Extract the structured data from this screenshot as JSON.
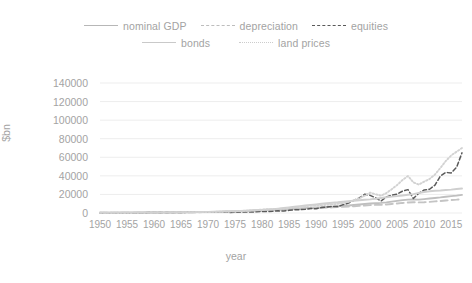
{
  "chart_data": {
    "type": "line",
    "title": "",
    "xlabel": "year",
    "ylabel": "$bn",
    "xlim": [
      1950,
      2017
    ],
    "ylim": [
      0,
      140000
    ],
    "grid": true,
    "legend_position": "top",
    "xticks": [
      1950,
      1955,
      1960,
      1965,
      1970,
      1975,
      1980,
      1985,
      1990,
      1995,
      2000,
      2005,
      2010,
      2015
    ],
    "yticks": [
      0,
      20000,
      40000,
      60000,
      80000,
      100000,
      120000,
      140000
    ],
    "x": [
      1950,
      1951,
      1952,
      1953,
      1954,
      1955,
      1956,
      1957,
      1958,
      1959,
      1960,
      1961,
      1962,
      1963,
      1964,
      1965,
      1966,
      1967,
      1968,
      1969,
      1970,
      1971,
      1972,
      1973,
      1974,
      1975,
      1976,
      1977,
      1978,
      1979,
      1980,
      1981,
      1982,
      1983,
      1984,
      1985,
      1986,
      1987,
      1988,
      1989,
      1990,
      1991,
      1992,
      1993,
      1994,
      1995,
      1996,
      1997,
      1998,
      1999,
      2000,
      2001,
      2002,
      2003,
      2004,
      2005,
      2006,
      2007,
      2008,
      2009,
      2010,
      2011,
      2012,
      2013,
      2014,
      2015,
      2016,
      2017
    ],
    "series": [
      {
        "name": "nominal GDP",
        "style": "solid",
        "color": "#bfbfbf",
        "values": [
          300,
          340,
          360,
          380,
          390,
          420,
          440,
          470,
          480,
          520,
          540,
          560,
          600,
          640,
          690,
          740,
          810,
          860,
          940,
          1020,
          1080,
          1170,
          1280,
          1430,
          1550,
          1690,
          1880,
          2090,
          2360,
          2630,
          2860,
          3210,
          3340,
          3630,
          4040,
          4340,
          4580,
          4860,
          5250,
          5660,
          5980,
          6170,
          6540,
          6880,
          7310,
          7660,
          8100,
          8610,
          9090,
          9660,
          10250,
          10580,
          10940,
          11460,
          12210,
          13040,
          13810,
          14450,
          14710,
          14450,
          14990,
          15540,
          16200,
          16780,
          17520,
          18220,
          18710,
          19490
        ]
      },
      {
        "name": "depreciation",
        "style": "longdash",
        "color": "#c4c4c4",
        "values": [
          250,
          280,
          300,
          320,
          340,
          370,
          400,
          430,
          450,
          480,
          500,
          520,
          550,
          580,
          620,
          670,
          720,
          780,
          850,
          930,
          1000,
          1080,
          1180,
          1300,
          1460,
          1620,
          1780,
          1980,
          2220,
          2500,
          2780,
          3080,
          3300,
          3470,
          3720,
          3990,
          4220,
          4450,
          4740,
          5070,
          5380,
          5600,
          5790,
          6010,
          6310,
          6640,
          6970,
          7340,
          7690,
          8060,
          8520,
          8800,
          8920,
          9190,
          9660,
          10240,
          10840,
          11300,
          11570,
          11390,
          11620,
          12000,
          12500,
          12960,
          13480,
          13960,
          14380,
          14980
        ]
      },
      {
        "name": "equities",
        "style": "shortdash",
        "color": "#595959",
        "values": [
          150,
          180,
          200,
          210,
          230,
          280,
          300,
          290,
          380,
          420,
          440,
          480,
          460,
          540,
          600,
          650,
          680,
          760,
          860,
          830,
          790,
          880,
          1030,
          900,
          660,
          880,
          1060,
          990,
          1050,
          1250,
          1650,
          1620,
          1890,
          2290,
          2240,
          2830,
          3380,
          3550,
          3960,
          4800,
          4600,
          5900,
          6400,
          7100,
          7100,
          9000,
          10800,
          13600,
          16200,
          20200,
          19000,
          16400,
          12900,
          17200,
          19200,
          20400,
          23600,
          25200,
          15600,
          21200,
          24800,
          25600,
          30100,
          39800,
          43600,
          43200,
          49200,
          64800
        ]
      },
      {
        "name": "bonds",
        "style": "solid",
        "color": "#cfcfcf",
        "values": [
          380,
          400,
          420,
          440,
          460,
          480,
          500,
          520,
          550,
          580,
          610,
          650,
          690,
          730,
          780,
          830,
          890,
          960,
          1040,
          1120,
          1220,
          1330,
          1450,
          1580,
          1720,
          1900,
          2120,
          2370,
          2630,
          2930,
          3270,
          3690,
          4130,
          4700,
          5330,
          6030,
          6800,
          7400,
          8060,
          8700,
          9320,
          9960,
          10550,
          11100,
          11550,
          12150,
          12700,
          13200,
          13750,
          14300,
          14700,
          15300,
          16100,
          16900,
          17600,
          18200,
          18900,
          19700,
          20300,
          21600,
          22600,
          23400,
          24000,
          24300,
          24800,
          25200,
          25800,
          26400
        ]
      },
      {
        "name": "land prices",
        "style": "dotted",
        "color": "#d2d2d2",
        "values": [
          200,
          230,
          250,
          270,
          300,
          330,
          360,
          380,
          410,
          450,
          480,
          510,
          550,
          600,
          650,
          700,
          760,
          830,
          910,
          1000,
          1080,
          1200,
          1350,
          1550,
          1700,
          1900,
          2150,
          2450,
          2850,
          3300,
          3750,
          4100,
          4250,
          4500,
          4900,
          5400,
          6000,
          6600,
          7250,
          7900,
          8300,
          8500,
          8800,
          9300,
          9900,
          10800,
          12000,
          13800,
          15800,
          18600,
          22000,
          20200,
          18600,
          21500,
          25600,
          30200,
          35600,
          39800,
          33000,
          30600,
          33800,
          36600,
          41500,
          48500,
          56000,
          62000,
          66000,
          70000
        ]
      }
    ],
    "series_display_scale_note": ""
  },
  "legend": {
    "rows": [
      [
        {
          "label": "nominal GDP",
          "key": "solid"
        },
        {
          "label": "depreciation",
          "key": "dash"
        },
        {
          "label": "equities",
          "key": "shortdash"
        }
      ],
      [
        {
          "label": "bonds",
          "key": "bonds"
        },
        {
          "label": "land prices",
          "key": "dot"
        }
      ]
    ]
  },
  "colors": {
    "nominal_gdp": "#bfbfbf",
    "depreciation": "#c4c4c4",
    "equities": "#595959",
    "bonds": "#cfcfcf",
    "land_prices": "#d2d2d2",
    "grid": "#ededed",
    "text": "#a3a3a3",
    "background": "#ffffff"
  }
}
